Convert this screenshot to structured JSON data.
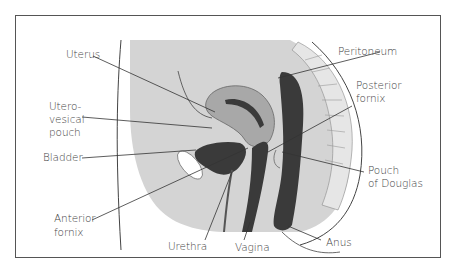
{
  "diagram": {
    "colors": {
      "background": "#ffffff",
      "frame": "#555555",
      "tissue": "#d4d4d4",
      "uterus": "#a8a8a8",
      "dark_organs": "#3a3a3a",
      "label_text": "#444444",
      "leader_lines": "#333333"
    },
    "labels": {
      "uterus": "Uterus",
      "uterovesical_line1": "Utero-",
      "uterovesical_line2": "vesical",
      "uterovesical_line3": "pouch",
      "bladder": "Bladder",
      "anterior_fornix_line1": "Anterior",
      "anterior_fornix_line2": "fornix",
      "urethra": "Urethra",
      "vagina": "Vagina",
      "anus": "Anus",
      "peritoneum": "Peritoneum",
      "posterior_fornix_line1": "Posterior",
      "posterior_fornix_line2": "fornix",
      "pouch_of_douglas_line1": "Pouch",
      "pouch_of_douglas_line2": "of Douglas"
    }
  }
}
